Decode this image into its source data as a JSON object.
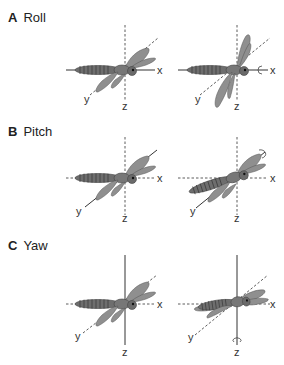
{
  "figure": {
    "panels": [
      {
        "letter": "A",
        "title": "Roll"
      },
      {
        "letter": "B",
        "title": "Pitch"
      },
      {
        "letter": "C",
        "title": "Yaw"
      }
    ],
    "axes": {
      "x": "x",
      "y": "y",
      "z": "z"
    },
    "colors": {
      "body": "#6e6e6e",
      "wing": "#8f8f8f",
      "axis": "#333333",
      "background": "#ffffff"
    }
  }
}
